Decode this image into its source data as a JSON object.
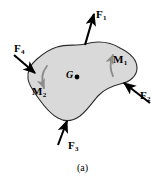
{
  "figure": {
    "caption": "(a)",
    "body_label": "G",
    "colors": {
      "body_fill": "#d9d9d9",
      "body_stroke": "#2b2b2b",
      "arrow": "#000000",
      "moment_arrow": "#8c8c8c",
      "background": "#ffffff",
      "text": "#000000"
    },
    "forces": [
      {
        "id": "F1",
        "symbol": "F",
        "subscript": "1",
        "label": "F1",
        "direction": "up-right",
        "tail": [
          85,
          45
        ],
        "head": [
          94,
          12
        ]
      },
      {
        "id": "F2",
        "symbol": "F",
        "subscript": "2",
        "label": "F2",
        "direction": "up-left",
        "tail": [
          150,
          103
        ],
        "head": [
          122,
          81
        ]
      },
      {
        "id": "F3",
        "symbol": "F",
        "subscript": "3",
        "label": "F3",
        "direction": "up",
        "tail": [
          58,
          145
        ],
        "head": [
          68,
          119
        ]
      },
      {
        "id": "F4",
        "symbol": "F",
        "subscript": "4",
        "label": "F4",
        "direction": "down-right",
        "tail": [
          14,
          55
        ],
        "head": [
          37,
          75
        ]
      }
    ],
    "moments": [
      {
        "id": "M1",
        "symbol": "M",
        "subscript": "1",
        "label": "M1",
        "sense": "counterclockwise-up"
      },
      {
        "id": "M2",
        "symbol": "M",
        "subscript": "2",
        "label": "M2",
        "sense": "clockwise-down"
      }
    ]
  }
}
